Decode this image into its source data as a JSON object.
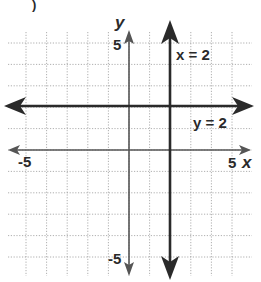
{
  "figure": {
    "corner_label": ")",
    "x_axis_label": "x",
    "y_axis_label": "y",
    "x_min_tick": "-5",
    "x_max_tick": "5",
    "y_max_tick": "5",
    "y_min_tick": "-5",
    "line_x_label": "x = 2",
    "line_y_label": "y = 2"
  },
  "chart_data": {
    "type": "line",
    "title": "",
    "xlabel": "x",
    "ylabel": "y",
    "xlim": [
      -6,
      6
    ],
    "ylim": [
      -6,
      6
    ],
    "grid": true,
    "tick_labels": {
      "x": [
        "-5",
        "5"
      ],
      "y": [
        "5",
        "-5"
      ]
    },
    "series": [
      {
        "name": "x = 2",
        "kind": "vertical",
        "x": 2,
        "points": [
          [
            2,
            -6
          ],
          [
            2,
            6
          ]
        ]
      },
      {
        "name": "y = 2",
        "kind": "horizontal",
        "y": 2,
        "points": [
          [
            -6,
            2
          ],
          [
            6,
            2
          ]
        ]
      }
    ]
  },
  "colors": {
    "grid": "#9a9a9a",
    "axis": "#555555",
    "line": "#2a2a2a",
    "text": "#2a2a2a"
  }
}
